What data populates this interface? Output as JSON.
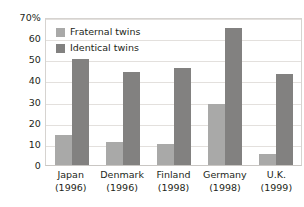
{
  "chart_data": {
    "type": "bar",
    "title": "",
    "xlabel": "",
    "ylabel": "",
    "ylim": [
      0,
      70
    ],
    "yticks": [
      0,
      10,
      20,
      30,
      40,
      50,
      60,
      70
    ],
    "ytick_labels": [
      "0",
      "10",
      "20",
      "30",
      "40",
      "50",
      "60",
      "70%"
    ],
    "grid": true,
    "legend_position": "top-left inside plot",
    "categories": [
      "Japan",
      "Denmark",
      "Finland",
      "Germany",
      "U.K."
    ],
    "category_years": [
      "(1996)",
      "(1996)",
      "(1998)",
      "(1998)",
      "(1999)"
    ],
    "series": [
      {
        "name": "Fraternal twins",
        "color": "#a9a9a8",
        "values": [
          14,
          11,
          10,
          29,
          5
        ]
      },
      {
        "name": "Identical twins",
        "color": "#828180",
        "values": [
          50,
          44,
          46,
          65,
          43
        ]
      }
    ]
  },
  "colors": {
    "fraternal": "#a9a9a8",
    "identical": "#828180",
    "gridline": "#e3e0dd",
    "frame": "#d6d3d0",
    "text": "#231f20",
    "background": "#ffffff"
  }
}
